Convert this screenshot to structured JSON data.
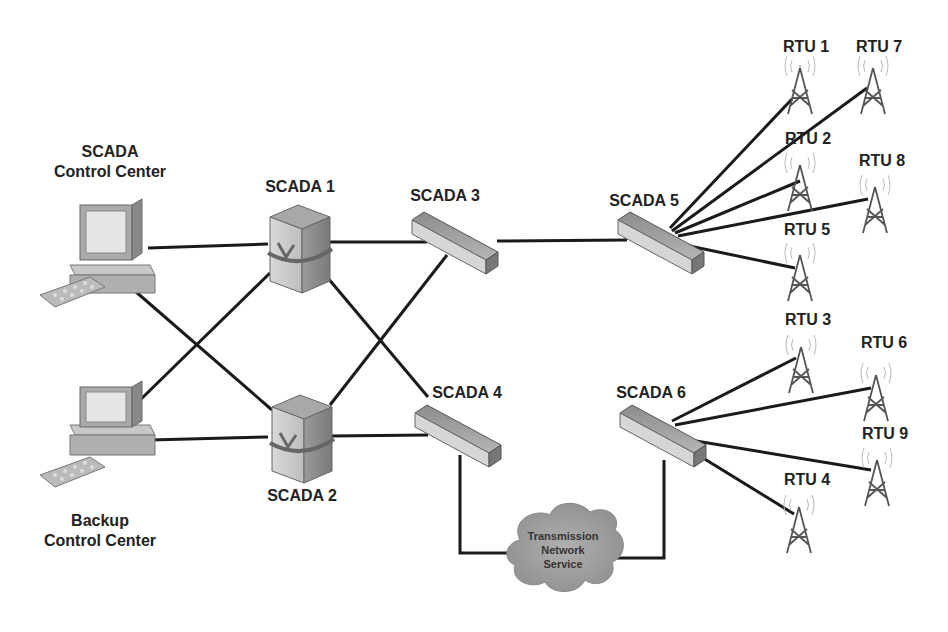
{
  "diagram": {
    "control_centers": [
      {
        "id": "primary",
        "label_line1": "SCADA",
        "label_line2": "Control Center"
      },
      {
        "id": "backup",
        "label_line1": "Backup",
        "label_line2": "Control Center"
      }
    ],
    "servers": [
      {
        "id": "scada1",
        "label": "SCADA 1"
      },
      {
        "id": "scada2",
        "label": "SCADA 2"
      }
    ],
    "switches": [
      {
        "id": "scada3",
        "label": "SCADA 3"
      },
      {
        "id": "scada4",
        "label": "SCADA 4"
      },
      {
        "id": "scada5",
        "label": "SCADA 5"
      },
      {
        "id": "scada6",
        "label": "SCADA 6"
      }
    ],
    "rtus": [
      {
        "id": "rtu1",
        "label": "RTU 1"
      },
      {
        "id": "rtu2",
        "label": "RTU 2"
      },
      {
        "id": "rtu3",
        "label": "RTU 3"
      },
      {
        "id": "rtu4",
        "label": "RTU 4"
      },
      {
        "id": "rtu5",
        "label": "RTU 5"
      },
      {
        "id": "rtu6",
        "label": "RTU 6"
      },
      {
        "id": "rtu7",
        "label": "RTU 7"
      },
      {
        "id": "rtu8",
        "label": "RTU 8"
      },
      {
        "id": "rtu9",
        "label": "RTU 9"
      }
    ],
    "cloud": {
      "line1": "Transmission",
      "line2": "Network",
      "line3": "Service"
    },
    "connections": [
      [
        "primary",
        "scada1"
      ],
      [
        "primary",
        "scada2"
      ],
      [
        "backup",
        "scada1"
      ],
      [
        "backup",
        "scada2"
      ],
      [
        "scada1",
        "scada3"
      ],
      [
        "scada1",
        "scada4"
      ],
      [
        "scada2",
        "scada3"
      ],
      [
        "scada2",
        "scada4"
      ],
      [
        "scada3",
        "scada5"
      ],
      [
        "scada4",
        "cloud"
      ],
      [
        "cloud",
        "scada6"
      ],
      [
        "scada5",
        "rtu1"
      ],
      [
        "scada5",
        "rtu7"
      ],
      [
        "scada5",
        "rtu2"
      ],
      [
        "scada5",
        "rtu8"
      ],
      [
        "scada5",
        "rtu5"
      ],
      [
        "scada6",
        "rtu3"
      ],
      [
        "scada6",
        "rtu6"
      ],
      [
        "scada6",
        "rtu9"
      ],
      [
        "scada6",
        "rtu4"
      ]
    ]
  }
}
